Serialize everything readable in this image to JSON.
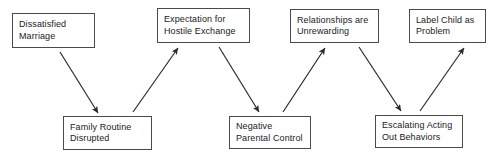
{
  "diagram": {
    "canvas": {
      "width": 493,
      "height": 159,
      "background": "#ffffff"
    },
    "style": {
      "box_border_color": "#4a4a4a",
      "arrow_color": "#2b2b2b",
      "text_color": "#1a1a1a"
    },
    "nodes": [
      {
        "id": "dissatisfied-marriage",
        "line1": "Dissatisfied",
        "line2": "Marriage",
        "x": 12,
        "y": 13,
        "w": 83,
        "h": 35
      },
      {
        "id": "expectation-hostile-exchange",
        "line1": "Expectation for",
        "line2": "Hostile Exchange",
        "x": 157,
        "y": 8,
        "w": 93,
        "h": 35
      },
      {
        "id": "relationships-unrewarding",
        "line1": "Relationships are",
        "line2": "Unrewarding",
        "x": 290,
        "y": 9,
        "w": 89,
        "h": 34
      },
      {
        "id": "label-child-as-problem",
        "line1": "Label Child as",
        "line2": "Problem",
        "x": 409,
        "y": 9,
        "w": 77,
        "h": 34
      },
      {
        "id": "family-routine-disrupted",
        "line1": "Family Routine",
        "line2": "Disrupted",
        "x": 63,
        "y": 116,
        "w": 89,
        "h": 34
      },
      {
        "id": "negative-parental-control",
        "line1": "Negative",
        "line2": "Parental Control",
        "x": 229,
        "y": 116,
        "w": 82,
        "h": 33
      },
      {
        "id": "escalating-acting-out",
        "line1": "Escalating Acting",
        "line2": "Out Behaviors",
        "x": 375,
        "y": 115,
        "w": 88,
        "h": 33
      }
    ],
    "arrows": [
      {
        "id": "marriage-to-routine",
        "from": "dissatisfied-marriage",
        "to": "family-routine-disrupted",
        "x1": 60,
        "y1": 52,
        "x2": 98,
        "y2": 113
      },
      {
        "id": "routine-to-expectation",
        "from": "family-routine-disrupted",
        "to": "expectation-hostile-exchange",
        "x1": 133,
        "y1": 112,
        "x2": 178,
        "y2": 48
      },
      {
        "id": "expectation-to-control",
        "from": "expectation-hostile-exchange",
        "to": "negative-parental-control",
        "x1": 219,
        "y1": 47,
        "x2": 259,
        "y2": 112
      },
      {
        "id": "control-to-relationships",
        "from": "negative-parental-control",
        "to": "relationships-unrewarding",
        "x1": 283,
        "y1": 112,
        "x2": 325,
        "y2": 48
      },
      {
        "id": "relationships-to-escalating",
        "from": "relationships-unrewarding",
        "to": "escalating-acting-out",
        "x1": 359,
        "y1": 47,
        "x2": 401,
        "y2": 111
      },
      {
        "id": "escalating-to-label",
        "from": "escalating-acting-out",
        "to": "label-child-as-problem",
        "x1": 420,
        "y1": 111,
        "x2": 464,
        "y2": 48
      }
    ]
  }
}
